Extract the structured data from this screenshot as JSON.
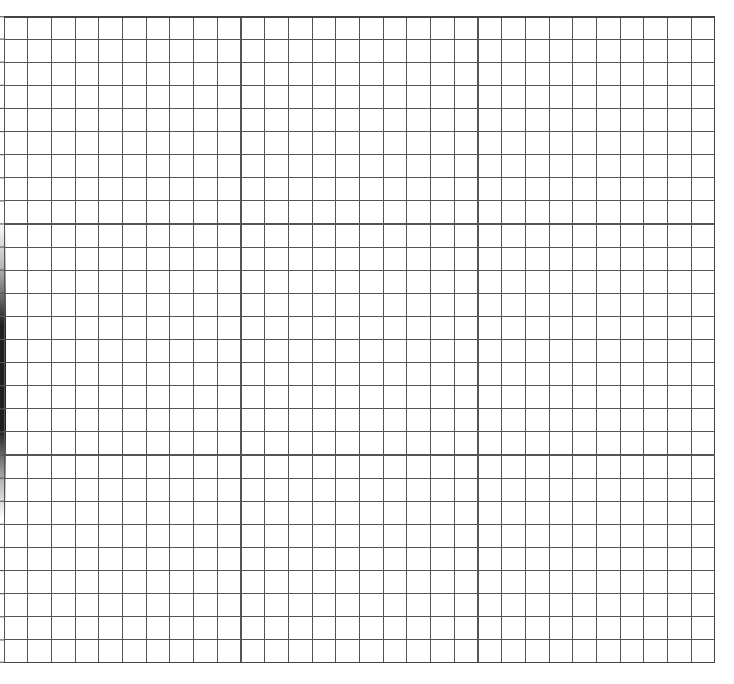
{
  "sheet": {
    "type": "graph-paper",
    "columns": 30,
    "rows": 28,
    "line_color": "#555555",
    "border_color": "#444444",
    "background_color": "#ffffff",
    "shadow_color": "#1a1a1a"
  }
}
